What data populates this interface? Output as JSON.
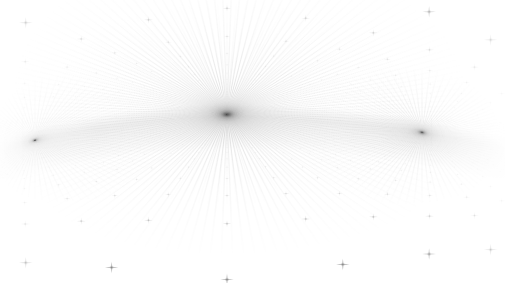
{
  "artwork": {
    "title": "Curvilinear Perspective Dot Grid",
    "type": "procedural-geometry",
    "description": "Fisheye / five-point curvilinear projection of an infinite planar point lattice, rendered as soft four-pointed star glyphs at every lattice intersection.",
    "canvas": {
      "width": 505,
      "height": 283
    },
    "background_color": "#ffffff"
  },
  "geometry": {
    "projection": "curvilinear-fisheye",
    "vanishing_points": [
      {
        "name": "center-vanishing-point",
        "x": 227,
        "y": 107,
        "role": "principal",
        "density": "highest"
      },
      {
        "name": "left-vanishing-point",
        "x": 35,
        "y": 140,
        "role": "lateral",
        "density": "high"
      },
      {
        "name": "right-vanishing-point",
        "x": 422,
        "y": 137,
        "role": "lateral",
        "density": "high"
      }
    ],
    "horizon": {
      "name": "curved-horizon-arc",
      "apex_x": 227,
      "apex_y": 116,
      "left_end": {
        "x": 0,
        "y": 150
      },
      "right_end": {
        "x": 505,
        "y": 148
      },
      "curvature": "convex-upward"
    },
    "lattice": {
      "rows": 46,
      "columns": 46,
      "spacing_world": 1.0,
      "eye_height": 1.0,
      "focal_length": 205,
      "camera_x": 0.0,
      "camera_z": 0.0
    },
    "mirror_plane": {
      "enabled": true,
      "axis": "horizon",
      "description": "Upper half mirrors the lower floor lattice about the curved horizon, forming a ceiling lattice."
    }
  },
  "glyph": {
    "name": "four-pointed-star",
    "shape": "cross-star",
    "arm_ratio_horizontal": 1.0,
    "arm_ratio_vertical": 0.85,
    "min_size_px": 0.6,
    "max_size_px": 7.0,
    "softness": 0.55
  },
  "palette": {
    "background": "#ffffff",
    "mark_darkest": "#6e6e6e",
    "mark_mid": "#9a9a9a",
    "mark_faint": "#d8d8d8",
    "mark_whisper": "#f2f2f2",
    "horizon_shadow": "#b9b9b9"
  },
  "rendering": {
    "alpha_near": 0.62,
    "alpha_far": 0.04,
    "falloff_exponent": 1.35,
    "antialias": true,
    "composite": "multiply"
  }
}
